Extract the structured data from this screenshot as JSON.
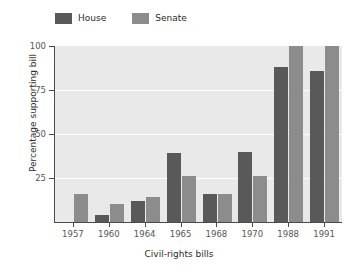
{
  "chart_data": {
    "type": "bar",
    "title": "",
    "subtitle": "",
    "xlabel": "Civil-rights bills",
    "ylabel": "Percentage supporting bill",
    "categories": [
      "1957",
      "1960",
      "1964",
      "1965",
      "1968",
      "1970",
      "1988",
      "1991"
    ],
    "series": [
      {
        "name": "House",
        "color": "#595959",
        "values": [
          0,
          4,
          12,
          39,
          16,
          40,
          88,
          86
        ]
      },
      {
        "name": "Senate",
        "color": "#8c8c8c",
        "values": [
          16,
          10,
          14,
          26,
          16,
          26,
          100,
          100
        ]
      }
    ],
    "ylim": [
      0,
      100
    ],
    "yticks": [
      25,
      50,
      75,
      100
    ],
    "ytick_labels": [
      "25",
      "50",
      "75",
      "100"
    ],
    "grid": "horizontal-white",
    "legend_position": "top-left",
    "plot_background": "#e9e9e9",
    "figure_background": "#ffffff",
    "axis_color": "#4a4a4a"
  },
  "legend": {
    "entries": [
      {
        "label": "House"
      },
      {
        "label": "Senate"
      }
    ]
  }
}
